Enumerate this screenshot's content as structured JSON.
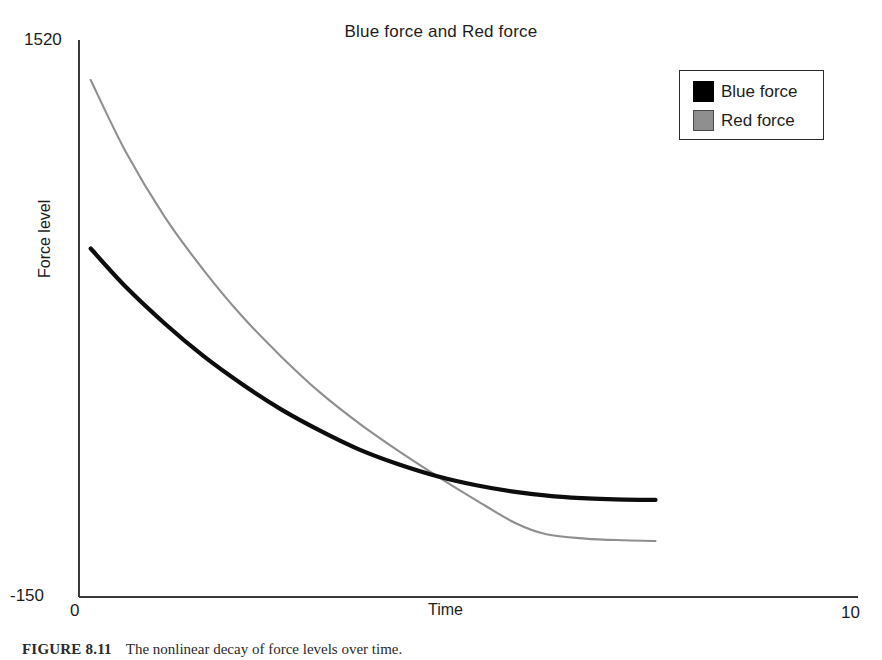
{
  "chart_data": {
    "type": "line",
    "title": "Blue force and Red force",
    "xlabel": "Time",
    "ylabel": "Force level",
    "xlim": [
      0,
      10
    ],
    "ylim": [
      -150,
      1520
    ],
    "xticks": [
      "0",
      "10"
    ],
    "yticks": [
      "1520",
      "-150"
    ],
    "grid": false,
    "legend_position": "top-right",
    "series": [
      {
        "name": "Blue force",
        "color": "#000000",
        "x": [
          0.15,
          0.6,
          1.1,
          1.6,
          2.1,
          2.6,
          3.1,
          3.6,
          4.1,
          4.6,
          5.1,
          5.6,
          6.1,
          6.6,
          7.0,
          7.4
        ],
        "y": [
          895,
          780,
          670,
          572,
          487,
          412,
          348,
          292,
          248,
          212,
          185,
          165,
          152,
          145,
          142,
          141
        ]
      },
      {
        "name": "Red force",
        "color": "#8f8f8f",
        "x": [
          0.15,
          0.6,
          1.1,
          1.6,
          2.1,
          2.6,
          3.1,
          3.6,
          4.1,
          4.6,
          5.1,
          5.6,
          6.0,
          6.5,
          7.0,
          7.4
        ],
        "y": [
          1400,
          1185,
          990,
          830,
          690,
          570,
          462,
          370,
          288,
          212,
          140,
          72,
          38,
          25,
          20,
          18
        ]
      }
    ]
  },
  "legend": {
    "items": [
      {
        "label": "Blue force",
        "swatch": "black"
      },
      {
        "label": "Red force",
        "swatch": "gray"
      }
    ]
  },
  "caption": {
    "label": "FIGURE 8.11",
    "text": "The nonlinear decay of force levels over time."
  },
  "colors": {
    "blue_force": "#000000",
    "red_force": "#8f8f8f",
    "axis": "#3a3a3a",
    "background": "#ffffff"
  }
}
